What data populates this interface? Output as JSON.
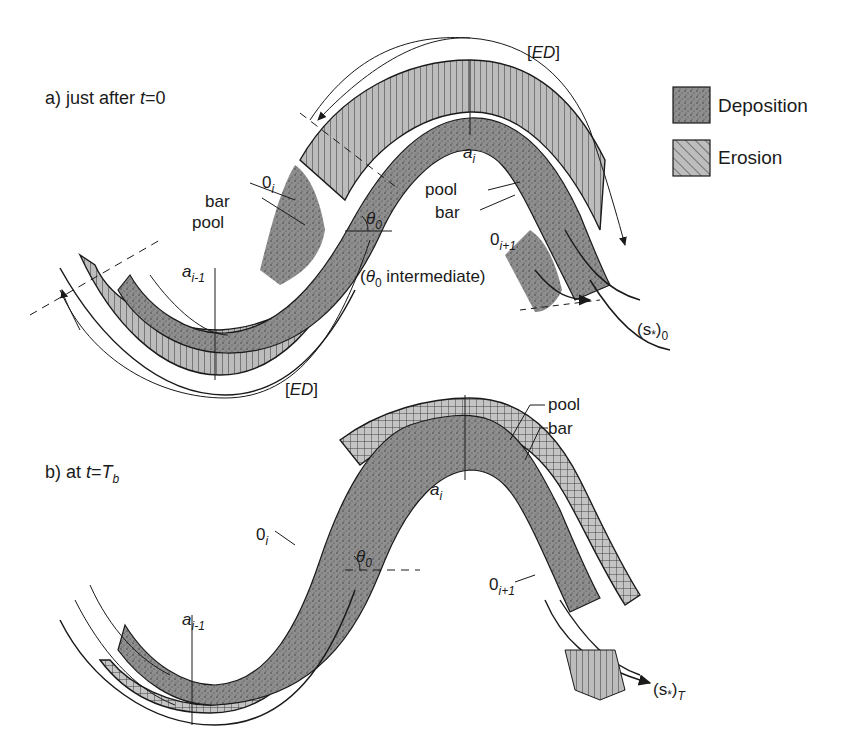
{
  "legend": {
    "items": [
      {
        "label": "Deposition",
        "pattern": "stipple",
        "fill": "#8e8e8e"
      },
      {
        "label": "Erosion",
        "pattern": "diagonal-hatch",
        "fill": "#bdbdbd"
      }
    ]
  },
  "panel_a": {
    "title_prefix": "a)  just after ",
    "title_var": "t",
    "title_suffix": "=0",
    "labels": {
      "ed_top": "ED",
      "ed_bottom": "ED",
      "a_i": "a",
      "a_i_sub": "i",
      "a_im1": "a",
      "a_im1_sub": "i-1",
      "o_i": "0",
      "o_i_sub": "i",
      "o_ip1": "0",
      "o_ip1_sub": "i+1",
      "bar_left": "bar",
      "pool_left": "pool",
      "pool_right": "pool",
      "bar_right": "bar",
      "theta": "θ",
      "theta_sub": "0",
      "theta_note_open": "(",
      "theta_note_var": "θ",
      "theta_note_sub": "0",
      "theta_note_text": " intermediate)",
      "s_label": "(s",
      "s_star": "*",
      "s_close": ")",
      "s_sub": "0"
    }
  },
  "panel_b": {
    "title_prefix": "b)  at ",
    "title_var": "t",
    "title_eq": "=",
    "title_T": "T",
    "title_T_sub": "b",
    "labels": {
      "a_i": "a",
      "a_i_sub": "i",
      "a_im1": "a",
      "a_im1_sub": "i-1",
      "o_i": "0",
      "o_i_sub": "i",
      "o_ip1": "0",
      "o_ip1_sub": "i+1",
      "pool": "pool",
      "bar": "bar",
      "theta": "θ",
      "theta_sub": "0",
      "s_label": "(s",
      "s_star": "*",
      "s_close": ")",
      "s_sub": "T"
    }
  },
  "colors": {
    "ink": "#1a1a1a",
    "deposition": "#8e8e8e",
    "erosion": "#b8b8b8"
  }
}
